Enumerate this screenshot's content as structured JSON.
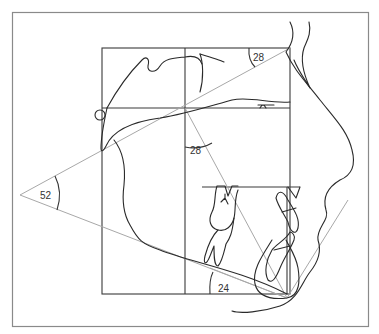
{
  "diagram": {
    "type": "cephalometric-tracing",
    "angles": [
      {
        "id": "facial-convexity",
        "label": "52"
      },
      {
        "id": "upper-right",
        "label": "28"
      },
      {
        "id": "middle",
        "label": "28"
      },
      {
        "id": "mandibular-plane",
        "label": "24"
      }
    ],
    "colors": {
      "frame": "#8a8a8a",
      "grid": "#3a3a3a",
      "reference_lines": "#a8a8a8",
      "tracing": "#2a2a2a"
    }
  }
}
